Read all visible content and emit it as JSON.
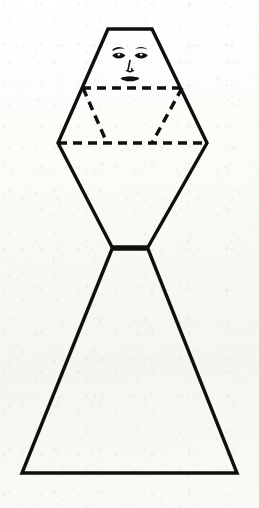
{
  "canvas": {
    "width": 259,
    "height": 508,
    "background_color": "#fdfdfb",
    "ink_color": "#100f0d",
    "media": "scanned paper",
    "title": "Stylized human figure built from a hexagon and a triangle"
  },
  "diagram": {
    "name": "geometric-human-figure",
    "line_styles": {
      "outline": "solid",
      "construction": "dashed",
      "outline_width_px": 3,
      "construction_width_px": 3,
      "dash_pattern": "9 6"
    },
    "parts": [
      {
        "id": "upper-hexagon",
        "label": "Upper body hexagon",
        "style": "solid",
        "points": "108,29 152,29 207,143 148,247 112,247 58,143"
      },
      {
        "id": "lower-triangle",
        "label": "Lower skirt triangle",
        "style": "solid",
        "points": "112,249 22,473 237,473 148,249"
      },
      {
        "id": "shoulder-line",
        "label": "Upper dashed shoulder line",
        "style": "dashed",
        "x1": 82,
        "y1": 88,
        "x2": 183,
        "y2": 88
      },
      {
        "id": "hip-line",
        "label": "Lower dashed hip line",
        "style": "dashed",
        "x1": 58,
        "y1": 143,
        "x2": 207,
        "y2": 143
      },
      {
        "id": "left-diagonal",
        "label": "Left dashed diagonal",
        "style": "dashed",
        "x1": 83,
        "y1": 88,
        "x2": 107,
        "y2": 143
      },
      {
        "id": "right-diagonal",
        "label": "Right dashed diagonal",
        "style": "dashed",
        "x1": 182,
        "y1": 88,
        "x2": 152,
        "y2": 143
      },
      {
        "id": "waist-line",
        "label": "Dashed waist connector",
        "style": "dashed",
        "x1": 113,
        "y1": 248,
        "x2": 147,
        "y2": 248
      }
    ],
    "face": {
      "label": "Drawn face",
      "center_x": 130,
      "features": [
        {
          "id": "left-eyebrow",
          "label": "Left eyebrow"
        },
        {
          "id": "right-eyebrow",
          "label": "Right eyebrow"
        },
        {
          "id": "left-eye",
          "label": "Left eye"
        },
        {
          "id": "right-eye",
          "label": "Right eye"
        },
        {
          "id": "nose",
          "label": "Nose"
        },
        {
          "id": "mouth",
          "label": "Mouth"
        }
      ]
    },
    "vertices": [
      {
        "id": "top-left",
        "label": "Top left corner",
        "x": 108,
        "y": 29
      },
      {
        "id": "top-right",
        "label": "Top right corner",
        "x": 152,
        "y": 29
      },
      {
        "id": "mid-left",
        "label": "Left widest point",
        "x": 58,
        "y": 143
      },
      {
        "id": "mid-right",
        "label": "Right widest point",
        "x": 207,
        "y": 143
      },
      {
        "id": "waist-left",
        "label": "Left waist point",
        "x": 112,
        "y": 247
      },
      {
        "id": "waist-right",
        "label": "Right waist point",
        "x": 148,
        "y": 247
      },
      {
        "id": "base-left",
        "label": "Base left corner",
        "x": 22,
        "y": 473
      },
      {
        "id": "base-right",
        "label": "Base right corner",
        "x": 237,
        "y": 473
      }
    ]
  }
}
